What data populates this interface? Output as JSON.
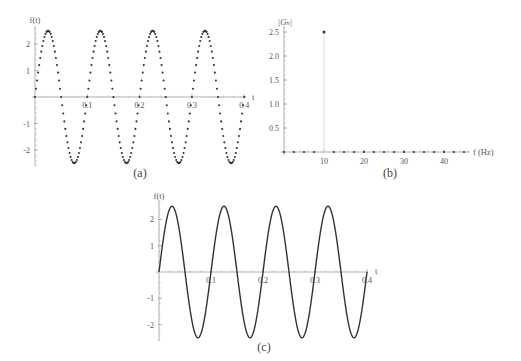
{
  "figure": {
    "colors": {
      "background": "#ffffff",
      "axis": "#a8a8a8",
      "text": "#555555",
      "data": "#333333",
      "stem": "#dddddd"
    }
  },
  "chart_data": [
    {
      "id": "a",
      "caption": "(a)",
      "type": "scatter",
      "title": "",
      "xlabel": "t",
      "ylabel": "f(t)",
      "function": "f(t) = 2.5 sin(2π·10·t)",
      "amplitude": 2.5,
      "frequency_hz": 10,
      "x_start": 0,
      "x_step": 0.002,
      "num_points": 201,
      "xlim": [
        0,
        0.4
      ],
      "ylim": [
        -2.5,
        2.5
      ],
      "x_ticks": [
        0.1,
        0.2,
        0.3,
        0.4
      ],
      "x_tick_labels": [
        "0.1",
        "0.2",
        "0.3",
        "0.4"
      ],
      "y_ticks": [
        -2,
        -1,
        1,
        2
      ],
      "y_tick_labels": [
        "-2",
        "-1",
        "1",
        "2"
      ],
      "grid": false,
      "legend": null
    },
    {
      "id": "b",
      "caption": "(b)",
      "type": "scatter",
      "title": "",
      "xlabel": "f (Hz)",
      "ylabel": "|Gₙ|",
      "x": [
        0,
        2.5,
        5,
        7.5,
        10,
        12.5,
        15,
        17.5,
        20,
        22.5,
        25,
        27.5,
        30,
        32.5,
        35,
        37.5,
        40,
        42.5,
        45
      ],
      "values": [
        0,
        0,
        0,
        0,
        2.5,
        0,
        0,
        0,
        0,
        0,
        0,
        0,
        0,
        0,
        0,
        0,
        0,
        0,
        0
      ],
      "stem_x": 10,
      "xlim": [
        0,
        46.5
      ],
      "ylim": [
        0,
        2.5
      ],
      "x_ticks": [
        10,
        20,
        30,
        40
      ],
      "x_tick_labels": [
        "10",
        "20",
        "30",
        "40"
      ],
      "y_ticks": [
        0.5,
        1.0,
        1.5,
        2.0,
        2.5
      ],
      "y_tick_labels": [
        "0.5",
        "1.0",
        "1.5",
        "2.0",
        "2.5"
      ],
      "grid": false,
      "legend": null
    },
    {
      "id": "c",
      "caption": "(c)",
      "type": "line",
      "title": "",
      "xlabel": "t",
      "ylabel": "f(t)",
      "function": "f(t) = 2.5 sin(2π·10·t)",
      "amplitude": 2.5,
      "frequency_hz": 10,
      "xlim": [
        0,
        0.4
      ],
      "ylim": [
        -2.5,
        2.5
      ],
      "x_ticks": [
        0.1,
        0.2,
        0.3,
        0.4
      ],
      "x_tick_labels": [
        "0.1",
        "0.2",
        "0.3",
        "0.4"
      ],
      "y_ticks": [
        -2,
        -1,
        1,
        2
      ],
      "y_tick_labels": [
        "-2",
        "-1",
        "1",
        "2"
      ],
      "grid": false,
      "legend": null
    }
  ]
}
